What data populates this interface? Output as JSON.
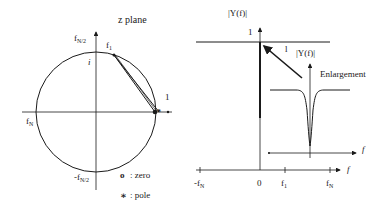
{
  "z_plane": {
    "title": "z plane",
    "top_axis_label": "f",
    "top_axis_sub": "N/2",
    "bottom_axis_label": "-f",
    "bottom_axis_sub": "N/2",
    "left_axis_label": "f",
    "left_axis_sub": "N",
    "imag_label": "i",
    "real_one_label": "1",
    "f1_label": "f",
    "f1_sub": "1",
    "legend": {
      "zero_symbol": "o",
      "zero_text": ": zero",
      "pole_symbol": "∗",
      "pole_text": ": pole"
    }
  },
  "response_plot": {
    "y_label": "|Y(f)|",
    "one_label": "1",
    "line_one_label": "l",
    "x_axis_label": "f",
    "ticks": {
      "neg_fn": "-f",
      "neg_fn_sub": "N",
      "zero": "0",
      "f1": "f",
      "f1_sub": "1",
      "fn": "f",
      "fn_sub": "N"
    },
    "inset": {
      "y_label": "|Y(f)|",
      "title": "Enlargement",
      "x_axis_label": "f"
    }
  },
  "colors": {
    "ink": "#1a1a1a",
    "background": "#ffffff"
  }
}
